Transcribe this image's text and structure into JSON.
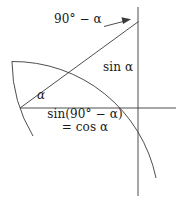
{
  "figure": {
    "kind": "trigonometry-diagram",
    "background_color": "#ffffff",
    "stroke_color": "#3a3a3a",
    "text_color": "#1a1a1a",
    "width": 177,
    "height": 199,
    "labels": {
      "complement_angle": "90° − α",
      "vertical_leg": "sin α",
      "base_angle": "α",
      "horizontal_leg_line1": "sin(90° − α)",
      "horizontal_leg_line2": "= cos α"
    },
    "geometry": {
      "origin_vertex": [
        20,
        108
      ],
      "top_vertex": [
        138,
        22
      ],
      "right_angle_vertex": [
        138,
        108
      ],
      "horizontal_axis": {
        "x1": 20,
        "y1": 108,
        "x2": 176,
        "y2": 108
      },
      "vertical_axis": {
        "x1": 138,
        "y1": 8,
        "x2": 138,
        "y2": 196
      },
      "hypotenuse": {
        "x1": 20,
        "y1": 108,
        "x2": 138,
        "y2": 22
      },
      "radius": 146,
      "major_arc_start": [
        12,
        62
      ],
      "major_arc_end": [
        155,
        177
      ],
      "minor_arc_start": [
        12,
        62
      ],
      "minor_arc_end": [
        33,
        135
      ],
      "leader_line": {
        "x1": 105,
        "y1": 26,
        "x2": 128,
        "y2": 20
      }
    }
  }
}
